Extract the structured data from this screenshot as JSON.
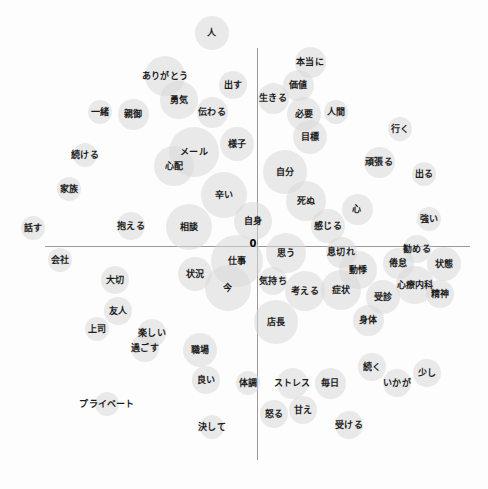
{
  "figure": {
    "title": "",
    "origin_label": "0",
    "background_color": "#fdfdfd",
    "bubble_color": "#d8d8d8",
    "axis_color": "#9a9a9a",
    "label_color": "#1d1d1d"
  },
  "chart_data": {
    "type": "scatter",
    "title": "",
    "subtitle": "",
    "xlabel": "",
    "ylabel": "",
    "xlim": [
      0,
      488
    ],
    "ylim": [
      0,
      489
    ],
    "grid": false,
    "legend": null,
    "axes": {
      "horizontal": {
        "y": 246,
        "x_start": 45,
        "x_end": 470
      },
      "vertical": {
        "x": 257,
        "y_start": 48,
        "y_end": 460
      },
      "origin": {
        "x": 257,
        "y": 246,
        "label": "0"
      }
    },
    "points": [
      {
        "label": "人",
        "x": 212,
        "y": 33,
        "size": 22
      },
      {
        "label": "本当に",
        "x": 310,
        "y": 62,
        "size": 20
      },
      {
        "label": "ありがとう",
        "x": 165,
        "y": 76,
        "size": 26
      },
      {
        "label": "出す",
        "x": 233,
        "y": 85,
        "size": 18
      },
      {
        "label": "価値",
        "x": 298,
        "y": 85,
        "size": 20
      },
      {
        "label": "生きる",
        "x": 273,
        "y": 98,
        "size": 20
      },
      {
        "label": "勇気",
        "x": 179,
        "y": 100,
        "size": 24
      },
      {
        "label": "伝わる",
        "x": 212,
        "y": 112,
        "size": 20
      },
      {
        "label": "必要",
        "x": 304,
        "y": 114,
        "size": 22
      },
      {
        "label": "人間",
        "x": 336,
        "y": 112,
        "size": 16
      },
      {
        "label": "一緒",
        "x": 100,
        "y": 112,
        "size": 16
      },
      {
        "label": "親御",
        "x": 133,
        "y": 114,
        "size": 20
      },
      {
        "label": "行く",
        "x": 400,
        "y": 129,
        "size": 16
      },
      {
        "label": "目標",
        "x": 310,
        "y": 137,
        "size": 22
      },
      {
        "label": "様子",
        "x": 237,
        "y": 144,
        "size": 22
      },
      {
        "label": "メール",
        "x": 194,
        "y": 152,
        "size": 32
      },
      {
        "label": "続ける",
        "x": 85,
        "y": 155,
        "size": 16
      },
      {
        "label": "心配",
        "x": 174,
        "y": 166,
        "size": 26
      },
      {
        "label": "頑張る",
        "x": 379,
        "y": 162,
        "size": 20
      },
      {
        "label": "自分",
        "x": 285,
        "y": 172,
        "size": 28
      },
      {
        "label": "出る",
        "x": 424,
        "y": 174,
        "size": 16
      },
      {
        "label": "辛い",
        "x": 224,
        "y": 195,
        "size": 30
      },
      {
        "label": "死ぬ",
        "x": 306,
        "y": 201,
        "size": 26
      },
      {
        "label": "家族",
        "x": 69,
        "y": 189,
        "size": 16
      },
      {
        "label": "心",
        "x": 357,
        "y": 209,
        "size": 20
      },
      {
        "label": "感じる",
        "x": 328,
        "y": 226,
        "size": 22
      },
      {
        "label": "強い",
        "x": 429,
        "y": 219,
        "size": 16
      },
      {
        "label": "自身",
        "x": 253,
        "y": 221,
        "size": 24
      },
      {
        "label": "相談",
        "x": 189,
        "y": 227,
        "size": 30
      },
      {
        "label": "抱える",
        "x": 131,
        "y": 226,
        "size": 18
      },
      {
        "label": "話す",
        "x": 33,
        "y": 228,
        "size": 16
      },
      {
        "label": "仕事",
        "x": 237,
        "y": 261,
        "size": 34
      },
      {
        "label": "思う",
        "x": 286,
        "y": 253,
        "size": 26
      },
      {
        "label": "息切れ",
        "x": 341,
        "y": 252,
        "size": 20
      },
      {
        "label": "勧める",
        "x": 417,
        "y": 249,
        "size": 18
      },
      {
        "label": "倦怠",
        "x": 398,
        "y": 263,
        "size": 20
      },
      {
        "label": "状態",
        "x": 444,
        "y": 264,
        "size": 22
      },
      {
        "label": "会社",
        "x": 60,
        "y": 260,
        "size": 16
      },
      {
        "label": "動悸",
        "x": 358,
        "y": 270,
        "size": 24
      },
      {
        "label": "状況",
        "x": 195,
        "y": 274,
        "size": 22
      },
      {
        "label": "気持ち",
        "x": 273,
        "y": 281,
        "size": 18
      },
      {
        "label": "考える",
        "x": 305,
        "y": 291,
        "size": 26
      },
      {
        "label": "症状",
        "x": 341,
        "y": 290,
        "size": 26
      },
      {
        "label": "心療内科",
        "x": 415,
        "y": 285,
        "size": 24
      },
      {
        "label": "受診",
        "x": 383,
        "y": 297,
        "size": 22
      },
      {
        "label": "今",
        "x": 228,
        "y": 288,
        "size": 30
      },
      {
        "label": "大切",
        "x": 115,
        "y": 280,
        "size": 18
      },
      {
        "label": "精神",
        "x": 440,
        "y": 294,
        "size": 18
      },
      {
        "label": "店長",
        "x": 276,
        "y": 322,
        "size": 28
      },
      {
        "label": "身体",
        "x": 368,
        "y": 320,
        "size": 20
      },
      {
        "label": "友人",
        "x": 118,
        "y": 311,
        "size": 18
      },
      {
        "label": "上司",
        "x": 97,
        "y": 329,
        "size": 16
      },
      {
        "label": "楽しい",
        "x": 152,
        "y": 333,
        "size": 18
      },
      {
        "label": "過ごす",
        "x": 145,
        "y": 348,
        "size": 18
      },
      {
        "label": "職場",
        "x": 200,
        "y": 350,
        "size": 22
      },
      {
        "label": "続く",
        "x": 372,
        "y": 367,
        "size": 18
      },
      {
        "label": "少し",
        "x": 427,
        "y": 373,
        "size": 18
      },
      {
        "label": "良い",
        "x": 206,
        "y": 380,
        "size": 18
      },
      {
        "label": "体調",
        "x": 248,
        "y": 383,
        "size": 16
      },
      {
        "label": "ストレス",
        "x": 292,
        "y": 383,
        "size": 20
      },
      {
        "label": "毎日",
        "x": 330,
        "y": 383,
        "size": 20
      },
      {
        "label": "いかが",
        "x": 397,
        "y": 383,
        "size": 18
      },
      {
        "label": "プライベート",
        "x": 107,
        "y": 404,
        "size": 16
      },
      {
        "label": "怒る",
        "x": 274,
        "y": 414,
        "size": 18
      },
      {
        "label": "甘え",
        "x": 303,
        "y": 410,
        "size": 18
      },
      {
        "label": "受ける",
        "x": 349,
        "y": 425,
        "size": 18
      },
      {
        "label": "決して",
        "x": 212,
        "y": 427,
        "size": 16
      }
    ]
  }
}
